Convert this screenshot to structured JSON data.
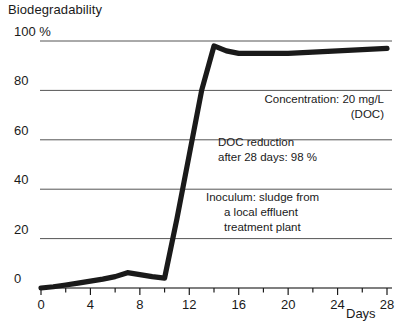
{
  "chart_data": {
    "type": "line",
    "title": "Biodegradability",
    "ylabel": "Biodegradability",
    "xlabel": "Days",
    "xlim": [
      0,
      28
    ],
    "ylim": [
      0,
      100
    ],
    "grid": true,
    "legend": "none",
    "y_ticks": [
      "0",
      "20",
      "40",
      "60",
      "80",
      "100 %"
    ],
    "y_tick_values": [
      0,
      20,
      40,
      60,
      80,
      100
    ],
    "x_ticks": [
      "0",
      "4",
      "8",
      "12",
      "16",
      "20",
      "24",
      "28"
    ],
    "x_tick_values": [
      0,
      4,
      8,
      12,
      16,
      20,
      24,
      28
    ],
    "x_minor_step": 2,
    "series": [
      {
        "name": "DOC removal",
        "x": [
          0,
          1,
          2,
          3,
          4,
          5,
          6,
          7,
          8,
          9,
          10,
          11,
          12,
          13,
          14,
          15,
          16,
          18,
          20,
          22,
          24,
          26,
          28
        ],
        "values": [
          0,
          0.5,
          1.2,
          2.0,
          2.8,
          3.6,
          4.6,
          6.2,
          5.4,
          4.6,
          4.0,
          28,
          54,
          80,
          98,
          96,
          95,
          95,
          95,
          95.5,
          96,
          96.5,
          97
        ]
      }
    ],
    "annotations": [
      {
        "id": "concentration",
        "lines": [
          "Concentration: 20 mg/L",
          "(DOC)"
        ]
      },
      {
        "id": "doc-reduction",
        "lines": [
          "DOC reduction",
          "after 28 days: 98 %"
        ]
      },
      {
        "id": "inoculum",
        "lines": [
          "Inoculum: sludge from",
          "a local effluent",
          "treatment plant"
        ]
      }
    ],
    "colors": {
      "line": "#1a1a1a",
      "grid": "#555555",
      "axis": "#1a1a1a",
      "background": "#ffffff",
      "text": "#1a1a1a"
    }
  }
}
